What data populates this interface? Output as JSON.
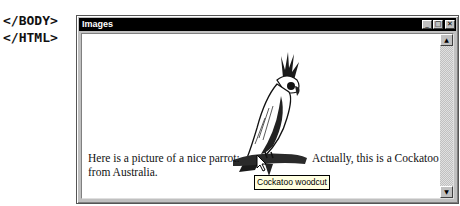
{
  "background_code": {
    "lines": [
      "</BODY>",
      "</HTML>"
    ]
  },
  "window": {
    "title": "Images",
    "controls": {
      "minimize": "_",
      "maximize": "□",
      "close": "✕"
    },
    "content": {
      "image": {
        "description": "Cockatoo woodcut illustration of a parrot on a branch",
        "icon": "parrot-image"
      },
      "text_left": "Here is a picture of a nice parrot:",
      "text_right": "Actually, this is a Cockatoo",
      "text_line2": "from Australia.",
      "tooltip": "Cockatoo woodcut"
    },
    "scrollbar": {
      "up_arrow": "▲",
      "down_arrow": "▼"
    }
  }
}
